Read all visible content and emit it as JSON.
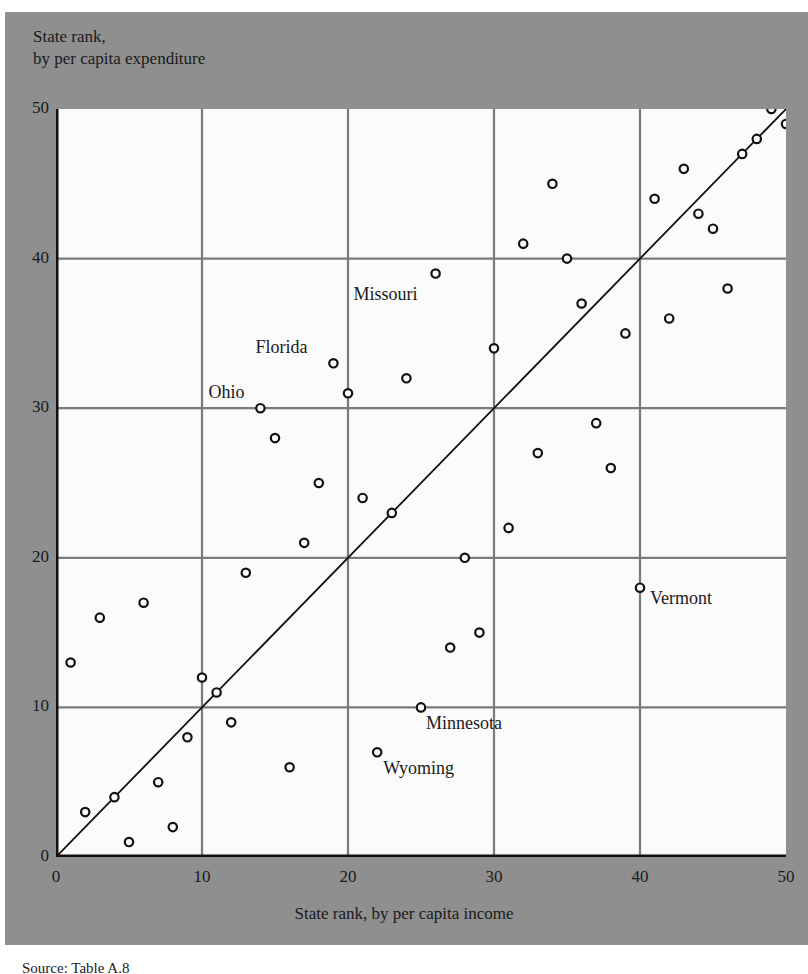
{
  "chart_data": {
    "type": "scatter",
    "title": "",
    "xlabel": "State rank, by per capita income",
    "ylabel_lines": [
      "State rank,",
      "by per capita expenditure"
    ],
    "xlim": [
      0,
      50
    ],
    "ylim": [
      0,
      50
    ],
    "x_ticks": [
      0,
      10,
      20,
      30,
      40,
      50
    ],
    "y_ticks": [
      0,
      10,
      20,
      30,
      40,
      50
    ],
    "grid": true,
    "reference_line": {
      "from": [
        0,
        0
      ],
      "to": [
        50,
        50
      ],
      "label": "y = x"
    },
    "points": [
      {
        "x": 1,
        "y": 13
      },
      {
        "x": 2,
        "y": 3
      },
      {
        "x": 3,
        "y": 16
      },
      {
        "x": 4,
        "y": 4
      },
      {
        "x": 5,
        "y": 1
      },
      {
        "x": 6,
        "y": 17
      },
      {
        "x": 7,
        "y": 5
      },
      {
        "x": 8,
        "y": 2
      },
      {
        "x": 9,
        "y": 8
      },
      {
        "x": 10,
        "y": 12
      },
      {
        "x": 11,
        "y": 11
      },
      {
        "x": 12,
        "y": 9
      },
      {
        "x": 13,
        "y": 19
      },
      {
        "x": 14,
        "y": 30,
        "label": "Ohio"
      },
      {
        "x": 15,
        "y": 28
      },
      {
        "x": 16,
        "y": 6
      },
      {
        "x": 17,
        "y": 21
      },
      {
        "x": 18,
        "y": 25
      },
      {
        "x": 19,
        "y": 33,
        "label": "Florida"
      },
      {
        "x": 20,
        "y": 31
      },
      {
        "x": 21,
        "y": 24
      },
      {
        "x": 22,
        "y": 7,
        "label": "Wyoming"
      },
      {
        "x": 23,
        "y": 23
      },
      {
        "x": 24,
        "y": 32
      },
      {
        "x": 25,
        "y": 10,
        "label": "Minnesota"
      },
      {
        "x": 26,
        "y": 39,
        "label": "Missouri"
      },
      {
        "x": 27,
        "y": 14
      },
      {
        "x": 28,
        "y": 20
      },
      {
        "x": 29,
        "y": 15
      },
      {
        "x": 30,
        "y": 34
      },
      {
        "x": 31,
        "y": 22
      },
      {
        "x": 32,
        "y": 41
      },
      {
        "x": 33,
        "y": 27
      },
      {
        "x": 34,
        "y": 45
      },
      {
        "x": 35,
        "y": 40
      },
      {
        "x": 36,
        "y": 37
      },
      {
        "x": 37,
        "y": 29
      },
      {
        "x": 38,
        "y": 26
      },
      {
        "x": 39,
        "y": 35
      },
      {
        "x": 40,
        "y": 18,
        "label": "Vermont"
      },
      {
        "x": 41,
        "y": 44
      },
      {
        "x": 42,
        "y": 36
      },
      {
        "x": 43,
        "y": 46
      },
      {
        "x": 44,
        "y": 43
      },
      {
        "x": 45,
        "y": 42
      },
      {
        "x": 46,
        "y": 38
      },
      {
        "x": 47,
        "y": 47
      },
      {
        "x": 48,
        "y": 48
      },
      {
        "x": 49,
        "y": 50
      },
      {
        "x": 50,
        "y": 49
      }
    ],
    "annotations": [
      {
        "text": "Missouri",
        "x": 26,
        "y": 39,
        "dx": -82,
        "dy": 10
      },
      {
        "text": "Florida",
        "x": 19,
        "y": 33,
        "dx": -78,
        "dy": -26
      },
      {
        "text": "Ohio",
        "x": 14,
        "y": 30,
        "dx": -52,
        "dy": -26
      },
      {
        "text": "Vermont",
        "x": 40,
        "y": 18,
        "dx": 10,
        "dy": 0
      },
      {
        "text": "Minnesota",
        "x": 25,
        "y": 10,
        "dx": 5,
        "dy": 6
      },
      {
        "text": "Wyoming",
        "x": 22,
        "y": 7,
        "dx": 6,
        "dy": 6
      }
    ]
  },
  "labels": {
    "y_axis_line1": "State rank,",
    "y_axis_line2": "by per capita expenditure",
    "x_axis": "State rank, by per capita income",
    "source": "Source: Table A.8"
  },
  "colors": {
    "panel_bg": "#8f8f8f",
    "plot_bg": "#fbfbfb",
    "grid": "#7a7a7a",
    "marker": "#111111",
    "line": "#111111"
  }
}
